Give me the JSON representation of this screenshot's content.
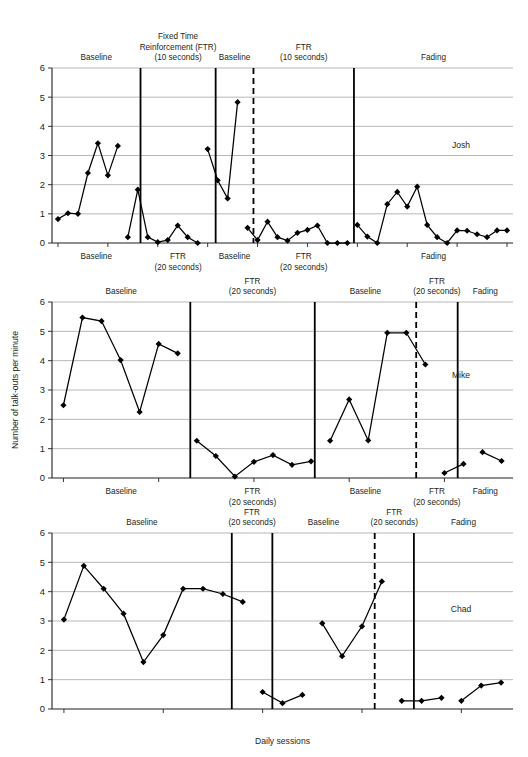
{
  "figure": {
    "y_axis_title": "Number of talk-outs per minute",
    "x_axis_title": "Daily sessions",
    "y_ticks": [
      "0",
      "1",
      "2",
      "3",
      "4",
      "5",
      "6"
    ],
    "marker_color": "#000000",
    "line_color": "#000000",
    "grid_color": "#9a9a9a"
  },
  "chart_data": {
    "type": "line",
    "title": "",
    "xlabel": "Daily sessions",
    "ylabel": "Number of talk-outs per minute",
    "ylim": [
      0,
      6
    ],
    "yticks": [
      0,
      1,
      2,
      3,
      4,
      5,
      6
    ],
    "grid": true,
    "legend": "none",
    "panels": [
      {
        "name": "josh-panel",
        "subject": "Josh",
        "phases_above": [
          {
            "label": "Baseline",
            "lines": [
              "Baseline"
            ]
          },
          {
            "label": "Fixed Time Reinforcement (FTR) (10 seconds)",
            "lines": [
              "Fixed Time",
              "Reinforcement (FTR)",
              "(10 seconds)"
            ]
          },
          {
            "label": "Baseline",
            "lines": [
              "Baseline"
            ]
          },
          {
            "label": "FTR (10 seconds)",
            "lines": [
              "FTR",
              "(10 seconds)"
            ]
          },
          {
            "label": "Fading",
            "lines": [
              "Fading"
            ]
          }
        ],
        "phases_below": [
          {
            "label": "Baseline",
            "lines": [
              "Baseline"
            ]
          },
          {
            "label": "FTR (20 seconds)",
            "lines": [
              "FTR",
              "(20 seconds)"
            ]
          },
          {
            "label": "Baseline",
            "lines": [
              "Baseline"
            ]
          },
          {
            "label": "FTR (20 seconds)",
            "lines": [
              "FTR",
              "(20 seconds)"
            ]
          },
          {
            "label": "Fading",
            "lines": [
              "Fading"
            ]
          }
        ],
        "segments": [
          {
            "phase": "Baseline",
            "x": [
              1,
              2,
              3,
              4,
              5,
              6,
              7
            ],
            "y": [
              0.82,
              1.02,
              1.0,
              2.4,
              3.42,
              2.32,
              3.33
            ]
          },
          {
            "phase": "FTR (10 seconds)",
            "x": [
              8,
              9,
              10,
              11,
              12,
              13,
              14,
              15
            ],
            "y": [
              0.2,
              1.83,
              0.2,
              0.03,
              0.1,
              0.6,
              0.2,
              0.0
            ]
          },
          {
            "phase": "Baseline",
            "x": [
              16,
              17,
              18,
              19
            ],
            "y": [
              3.22,
              2.15,
              1.53,
              4.83
            ]
          },
          {
            "phase": "FTR (10 seconds)",
            "x": [
              20,
              21,
              22,
              23,
              24,
              25,
              26,
              27,
              28,
              29,
              30
            ],
            "y": [
              0.52,
              0.1,
              0.73,
              0.2,
              0.08,
              0.35,
              0.45,
              0.6,
              0.0,
              0.0,
              0.0
            ]
          },
          {
            "phase": "Fading",
            "x": [
              31,
              32,
              33,
              34,
              35,
              36,
              37,
              38,
              39,
              40,
              41,
              42,
              43,
              44,
              45,
              46
            ],
            "y": [
              0.62,
              0.22,
              0.0,
              1.33,
              1.75,
              1.25,
              1.93,
              0.62,
              0.2,
              0.0,
              0.43,
              0.42,
              0.3,
              0.2,
              0.43,
              0.43
            ]
          }
        ]
      },
      {
        "name": "mike-panel",
        "subject": "Mike",
        "phases_above": [
          {
            "label": "Baseline",
            "lines": [
              "Baseline"
            ]
          },
          {
            "label": "FTR (20 seconds)",
            "lines": [
              "FTR",
              "(20 seconds)"
            ]
          },
          {
            "label": "Baseline",
            "lines": [
              "Baseline"
            ]
          },
          {
            "label": "FTR (20 seconds)",
            "lines": [
              "FTR",
              "(20 seconds)"
            ]
          },
          {
            "label": "Fading",
            "lines": [
              "Fading"
            ]
          }
        ],
        "phases_below": [
          {
            "label": "Baseline",
            "lines": [
              "Baseline"
            ]
          },
          {
            "label": "FTR (20 seconds)",
            "lines": [
              "FTR",
              "(20 seconds)"
            ]
          },
          {
            "label": "Baseline",
            "lines": [
              "Baseline"
            ]
          },
          {
            "label": "FTR (20 seconds)",
            "lines": [
              "FTR",
              "(20 seconds)"
            ]
          },
          {
            "label": "Fading",
            "lines": [
              "Fading"
            ]
          }
        ],
        "segments": [
          {
            "phase": "Baseline",
            "x": [
              1,
              2,
              3,
              4,
              5,
              6,
              7
            ],
            "y": [
              2.48,
              5.47,
              5.35,
              4.02,
              2.25,
              4.57,
              4.25
            ]
          },
          {
            "phase": "FTR (20 seconds)",
            "x": [
              8,
              9,
              10,
              11,
              12,
              13,
              14
            ],
            "y": [
              1.27,
              0.75,
              0.05,
              0.55,
              0.78,
              0.45,
              0.57
            ]
          },
          {
            "phase": "Baseline",
            "x": [
              15,
              16,
              17,
              18,
              19,
              20
            ],
            "y": [
              1.27,
              2.68,
              1.28,
              4.95,
              4.95,
              3.87
            ]
          },
          {
            "phase": "FTR (20 seconds)",
            "x": [
              21,
              22
            ],
            "y": [
              0.17,
              0.48
            ]
          },
          {
            "phase": "Fading",
            "x": [
              23,
              24
            ],
            "y": [
              0.88,
              0.58
            ]
          }
        ]
      },
      {
        "name": "chad-panel",
        "subject": "Chad",
        "phases_above": [
          {
            "label": "Baseline",
            "lines": [
              "Baseline"
            ]
          },
          {
            "label": "FTR (20 seconds)",
            "lines": [
              "FTR",
              "(20 seconds)"
            ]
          },
          {
            "label": "Baseline",
            "lines": [
              "Baseline"
            ]
          },
          {
            "label": "FTR (20 seconds)",
            "lines": [
              "FTR",
              "(20 seconds)"
            ]
          },
          {
            "label": "Fading",
            "lines": [
              "Fading"
            ]
          }
        ],
        "phases_below": [],
        "segments": [
          {
            "phase": "Baseline",
            "x": [
              1,
              2,
              3,
              4,
              5,
              6,
              7,
              8,
              9,
              10
            ],
            "y": [
              3.05,
              4.88,
              4.1,
              3.25,
              1.6,
              2.52,
              4.1,
              4.1,
              3.92,
              3.65
            ]
          },
          {
            "phase": "FTR (20 seconds)",
            "x": [
              11,
              12,
              13
            ],
            "y": [
              0.58,
              0.2,
              0.48
            ]
          },
          {
            "phase": "Baseline",
            "x": [
              14,
              15,
              16,
              17
            ],
            "y": [
              2.92,
              1.8,
              2.82,
              4.35
            ]
          },
          {
            "phase": "FTR (20 seconds)",
            "x": [
              18,
              19,
              20
            ],
            "y": [
              0.28,
              0.28,
              0.38
            ]
          },
          {
            "phase": "Fading",
            "x": [
              21,
              22,
              23
            ],
            "y": [
              0.28,
              0.8,
              0.9
            ]
          }
        ]
      }
    ]
  }
}
